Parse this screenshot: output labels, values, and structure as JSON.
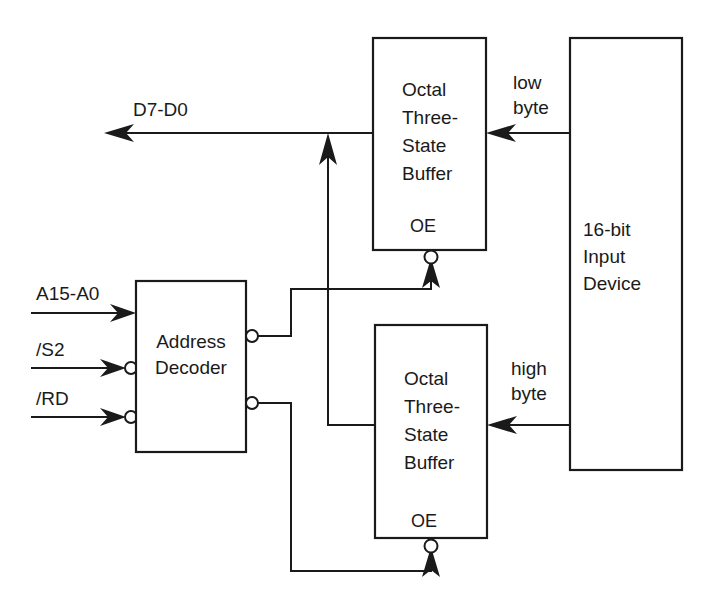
{
  "diagram": {
    "background_color": "#ffffff",
    "line_color": "#1a1a1a",
    "blocks": {
      "address_decoder": {
        "name": "address-decoder",
        "label_lines": [
          "Address",
          "Decoder"
        ],
        "x": 136,
        "y": 281,
        "w": 110,
        "h": 171
      },
      "buffer_low": {
        "name": "octal-three-state-buffer-low",
        "label_lines": [
          "Octal",
          "Three-",
          "State",
          "Buffer"
        ],
        "enable_label": "OE",
        "x": 373,
        "y": 38,
        "w": 113,
        "h": 212
      },
      "buffer_high": {
        "name": "octal-three-state-buffer-high",
        "label_lines": [
          "Octal",
          "Three-",
          "State",
          "Buffer"
        ],
        "enable_label": "OE",
        "x": 375,
        "y": 325,
        "w": 112,
        "h": 213
      },
      "input_device": {
        "name": "input-device",
        "label_lines": [
          "16-bit",
          "Input",
          "Device"
        ],
        "x": 570,
        "y": 38,
        "w": 112,
        "h": 432
      }
    },
    "signals": {
      "address_bus": "A15-A0",
      "select": "/S2",
      "read": "/RD",
      "data_bus": "D7-D0",
      "low_byte": "low byte",
      "low_byte_lines": [
        "low",
        "byte"
      ],
      "high_byte": "high byte",
      "high_byte_lines": [
        "high",
        "byte"
      ]
    }
  }
}
